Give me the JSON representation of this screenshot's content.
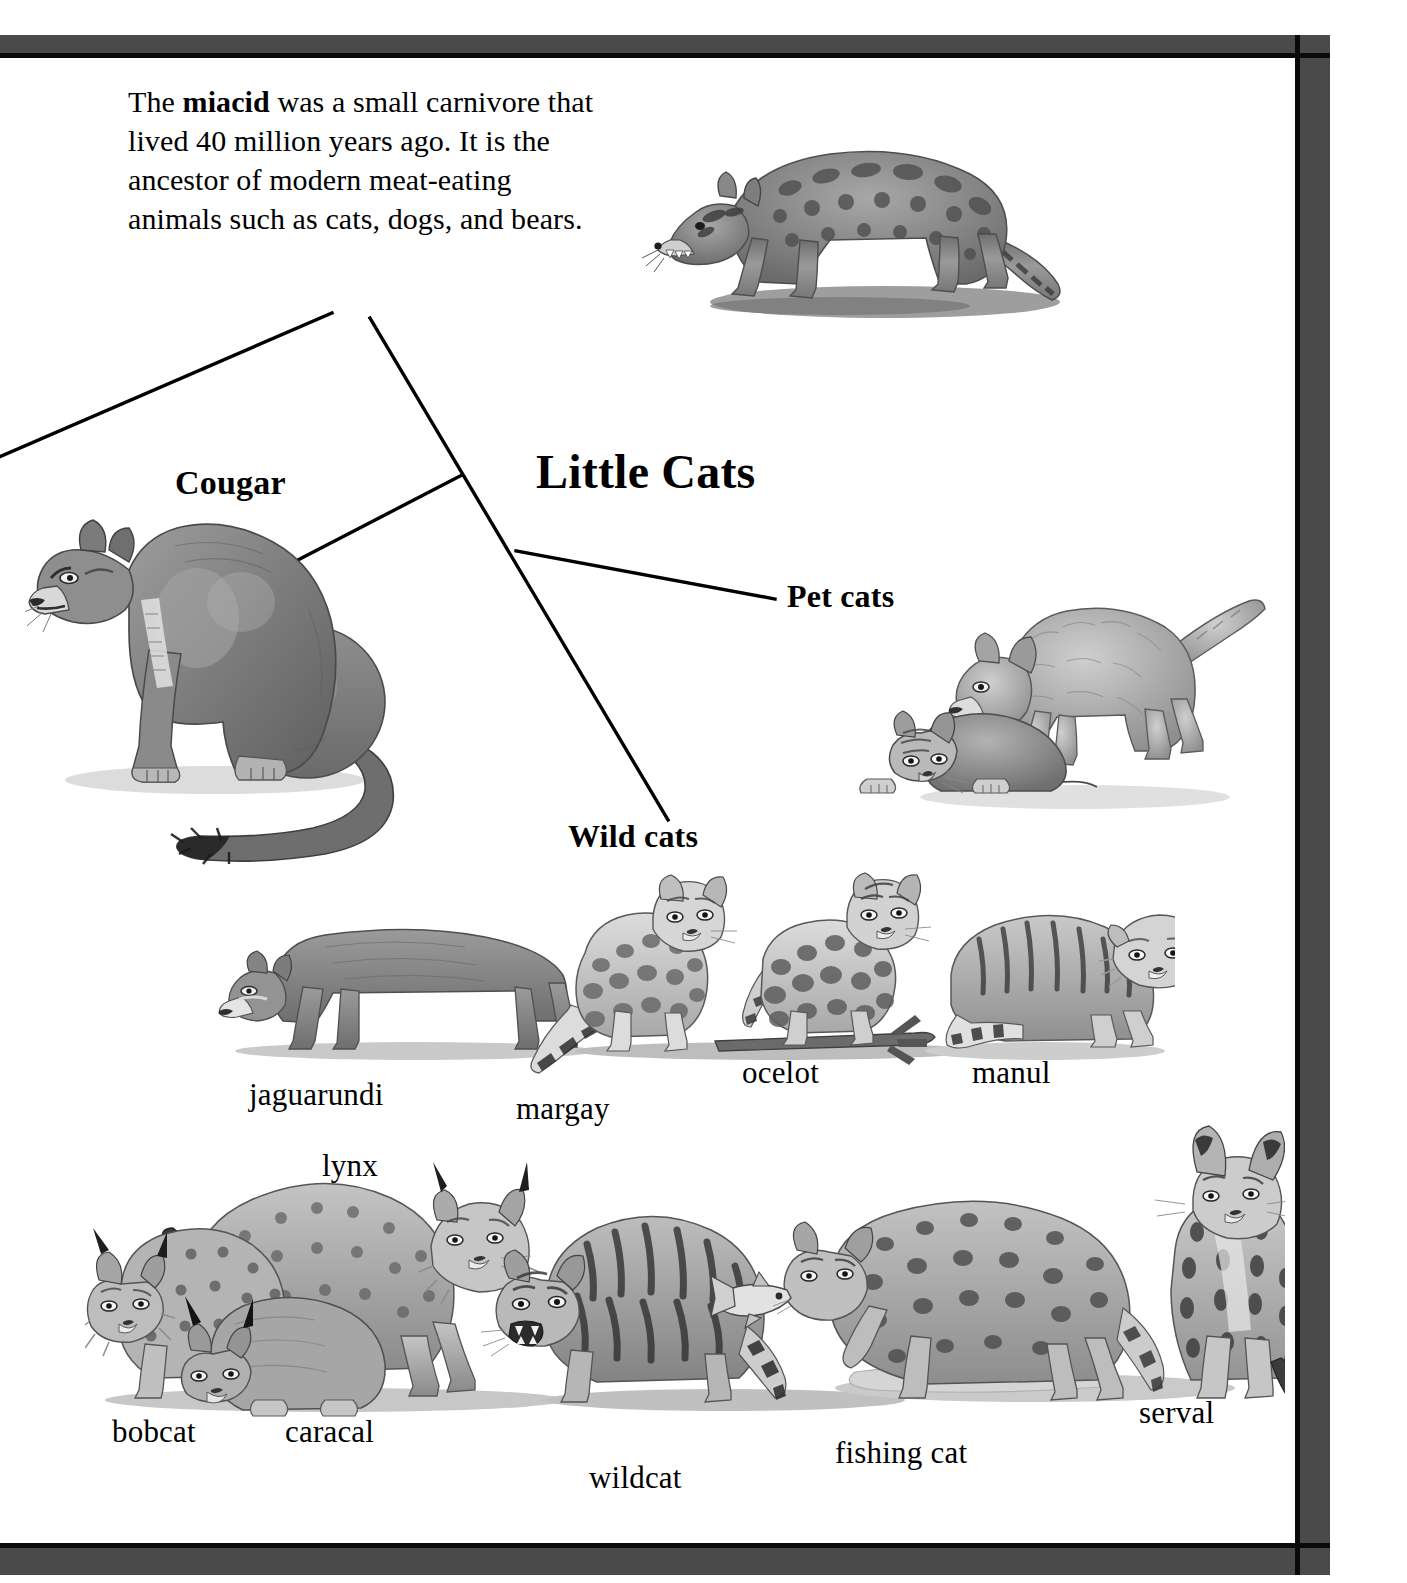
{
  "page": {
    "frame_color": "#4a4a4a",
    "inner_line_color": "#0a0a0a",
    "background": "#ffffff",
    "ink_color": "#000000"
  },
  "intro": {
    "prefix": "The ",
    "bold_term": "miacid",
    "body": " was a small carnivore that lived 40 million years ago. It is the ancestor of modern meat-eating animals such as cats, dogs, and bears."
  },
  "headings": {
    "title": "Little Cats",
    "cougar": "Cougar",
    "pet_cats": "Pet cats",
    "wild_cats": "Wild cats"
  },
  "species_labels": {
    "jaguarundi": "jaguarundi",
    "margay": "margay",
    "ocelot": "ocelot",
    "manul": "manul",
    "lynx": "lynx",
    "bobcat": "bobcat",
    "caracal": "caracal",
    "wildcat": "wildcat",
    "fishing_cat": "fishing cat",
    "serval": "serval"
  },
  "illustrations": {
    "miacid": "miacid-illustration",
    "cougar": "cougar-illustration",
    "pet_kittens": "pet-kittens-illustration",
    "wild_cats_middle_row": "wild-cats-middle-row-illustration",
    "wild_cats_bottom_row": "wild-cats-bottom-row-illustration"
  },
  "leader_lines": {
    "trunk_from_miacid": "line from miacid text down-right to Wild cats",
    "branch_to_cougar": "branch from trunk down-left to Cougar",
    "branch_to_pet_cats": "branch from trunk right to Pet cats",
    "branch_offpage_left": "line from miacid text down-left off page edge"
  }
}
